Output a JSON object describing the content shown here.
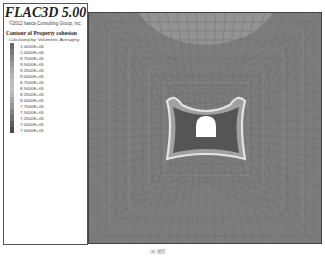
{
  "legend": {
    "title": "FLAC3D 5.00",
    "copyright": "©2012 Itasca Consulting Group, Inc.",
    "heading": "Contour of Property cohesion",
    "calc_method": "Calculated by: Volumetric Averaging",
    "entries": [
      {
        "value": "1.0000E+06",
        "color": "#6a6a6a"
      },
      {
        "value": "1.0000E+06",
        "color": "#7a7a7a"
      },
      {
        "value": "9.7500E+05",
        "color": "#8a8a8a"
      },
      {
        "value": "9.5000E+05",
        "color": "#9a9a9a"
      },
      {
        "value": "9.2500E+05",
        "color": "#a8a8a8"
      },
      {
        "value": "9.0000E+05",
        "color": "#b4b4b4"
      },
      {
        "value": "8.7500E+05",
        "color": "#bdbdbd"
      },
      {
        "value": "8.5000E+05",
        "color": "#c2c2c2"
      },
      {
        "value": "8.2500E+05",
        "color": "#b8b8b8"
      },
      {
        "value": "8.0000E+05",
        "color": "#a6a6a6"
      },
      {
        "value": "7.7500E+05",
        "color": "#949494"
      },
      {
        "value": "7.5000E+05",
        "color": "#828282"
      },
      {
        "value": "7.2500E+05",
        "color": "#707070"
      },
      {
        "value": "7.0000E+05",
        "color": "#5e5e5e"
      },
      {
        "value": "7.0000E+05",
        "color": "#4c4c4c"
      }
    ]
  },
  "plot": {
    "background_color": "#7c7c7c",
    "inner_zone_color": "#555555",
    "halo_color": "#d8d8d8",
    "top_highlight_color": "#9a9a9a",
    "tunnel_color": "#ffffff"
  },
  "caption": "(a) 模型"
}
